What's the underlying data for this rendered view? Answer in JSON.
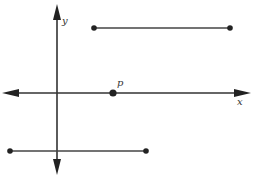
{
  "diagram": {
    "type": "coordinate-plane-with-segments",
    "colors": {
      "stroke": "#333333",
      "fill": "#222222",
      "background": "#ffffff"
    },
    "axes": {
      "x": {
        "label": "x",
        "from": [
          2,
          93
        ],
        "to": [
          251,
          93
        ],
        "arrows": "both",
        "label_pos": [
          239,
          104
        ]
      },
      "y": {
        "label": "y",
        "from": [
          57,
          175
        ],
        "to": [
          57,
          4
        ],
        "arrows": "both",
        "label_pos": [
          62,
          24
        ]
      }
    },
    "point_p": {
      "label": "p",
      "x": 113,
      "y": 93,
      "label_pos": [
        117,
        86
      ]
    },
    "segments": [
      {
        "name": "upper-segment",
        "x1": 94,
        "y1": 28,
        "x2": 230,
        "y2": 28
      },
      {
        "name": "lower-segment",
        "x1": 10,
        "y1": 151,
        "x2": 146,
        "y2": 151
      }
    ]
  }
}
